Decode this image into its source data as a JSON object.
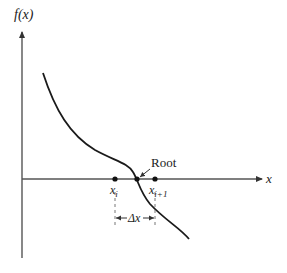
{
  "diagram": {
    "y_axis_label": "f(x)",
    "x_axis_label": "x",
    "root_label": "Root",
    "points": {
      "xi": {
        "base": "x",
        "sub": "i"
      },
      "xi1": {
        "base": "x",
        "sub": "i+1"
      }
    },
    "interval_label": "Δx",
    "colors": {
      "stroke": "#1a1a1a",
      "axis": "#555555",
      "dash": "#777777"
    }
  }
}
